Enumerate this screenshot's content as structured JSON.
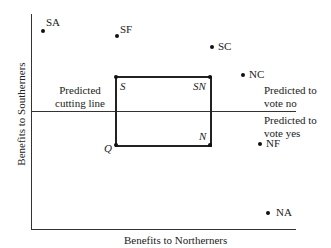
{
  "diagram": {
    "axes": {
      "x_label": "Benefits to Northerners",
      "y_label": "Benefits to Southerners"
    },
    "cutting_line": {
      "label_line1": "Predicted",
      "label_line2": "cutting line"
    },
    "regions": {
      "above_line1": "Predicted to",
      "above_line2": "vote no",
      "below_line1": "Predicted to",
      "below_line2": "vote yes"
    },
    "points": {
      "SA": "SA",
      "SF": "SF",
      "SC": "SC",
      "NC": "NC",
      "NF": "NF",
      "NA": "NA"
    },
    "box_corners": {
      "S": "S",
      "SN": "SN",
      "N": "N",
      "Q": "Q"
    }
  }
}
